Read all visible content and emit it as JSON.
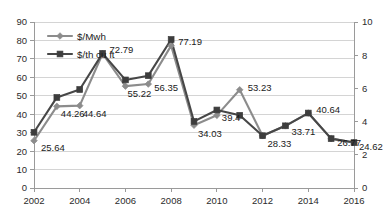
{
  "chart_data": {
    "type": "line",
    "title": "",
    "xlabel": "",
    "ylabel": "",
    "grid": true,
    "legend_position": "top-left-inside",
    "x": [
      2002,
      2003,
      2004,
      2005,
      2006,
      2007,
      2008,
      2009,
      2010,
      2011,
      2012,
      2013,
      2014,
      2015,
      2016
    ],
    "x_tick_labels": [
      "2002",
      "2004",
      "2006",
      "2008",
      "2010",
      "2012",
      "2014",
      "2016"
    ],
    "x_ticks": [
      2002,
      2004,
      2006,
      2008,
      2010,
      2012,
      2014,
      2016
    ],
    "xlim": [
      2002,
      2016
    ],
    "left_axis": {
      "ylim": [
        0,
        90
      ],
      "ticks": [
        0,
        10,
        20,
        30,
        40,
        50,
        60,
        70,
        80,
        90
      ],
      "tick_labels": [
        "0",
        "10",
        "20",
        "30",
        "40",
        "50",
        "60",
        "70",
        "80",
        "90"
      ]
    },
    "right_axis": {
      "ylim": [
        0,
        10
      ],
      "ticks": [
        0,
        2,
        4,
        6,
        8,
        10
      ],
      "tick_labels": [
        "0",
        "2",
        "4",
        "6",
        "8",
        "10"
      ]
    },
    "series": [
      {
        "name": "$/Mwh",
        "axis": "left",
        "marker": "diamond",
        "color": "#8c8c8c",
        "values": [
          25.64,
          44.26,
          44.64,
          72.79,
          55.22,
          56.35,
          77.19,
          34.03,
          39.4,
          53.23,
          28.33,
          33.71,
          40.64,
          26.77,
          24.62
        ]
      },
      {
        "name": "$/th cu ft",
        "axis": "left",
        "marker": "square",
        "color": "#3d3d3d",
        "values": [
          30.2,
          49.1,
          53.4,
          73.0,
          58.6,
          60.9,
          80.5,
          36.1,
          42.3,
          39.4,
          28.33,
          33.71,
          40.64,
          26.77,
          24.62
        ]
      }
    ],
    "data_labels": [
      {
        "text": "25.64",
        "x": 2002,
        "value": 25.64
      },
      {
        "text": "44.26",
        "x": 2003,
        "value": 44.26
      },
      {
        "text": "44.64",
        "x": 2004,
        "value": 44.64
      },
      {
        "text": "72.79",
        "x": 2005,
        "value": 72.79
      },
      {
        "text": "55.22",
        "x": 2006,
        "value": 55.22
      },
      {
        "text": "56.35",
        "x": 2007,
        "value": 56.35
      },
      {
        "text": "77.19",
        "x": 2008,
        "value": 77.19
      },
      {
        "text": "34.03",
        "x": 2009,
        "value": 34.03
      },
      {
        "text": "39.4",
        "x": 2010,
        "value": 39.4
      },
      {
        "text": "53.23",
        "x": 2011,
        "value": 53.23
      },
      {
        "text": "28.33",
        "x": 2012,
        "value": 28.33
      },
      {
        "text": "33.71",
        "x": 2013,
        "value": 33.71
      },
      {
        "text": "40.64",
        "x": 2014,
        "value": 40.64
      },
      {
        "text": "26.77",
        "x": 2015,
        "value": 26.77
      },
      {
        "text": "24.62",
        "x": 2016,
        "value": 24.62
      }
    ],
    "legend": [
      {
        "label": "$/Mwh",
        "marker": "diamond",
        "color": "#8c8c8c"
      },
      {
        "label": "$/th cu ft",
        "marker": "square",
        "color": "#3d3d3d"
      }
    ]
  }
}
